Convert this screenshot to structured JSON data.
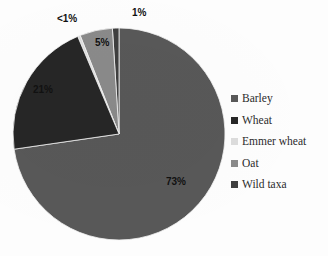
{
  "chart_data": {
    "type": "pie",
    "title": "",
    "subtitle": "",
    "xlabel": "",
    "ylabel": "",
    "grid": false,
    "legend_position": "right",
    "start_angle_deg": 0,
    "direction": "clockwise",
    "categories": [
      "Barley",
      "Wheat",
      "Emmer wheat",
      "Oat",
      "Wild taxa"
    ],
    "values": [
      73,
      21,
      0.4,
      5,
      1
    ],
    "value_labels": [
      "73%",
      "21%",
      "<1%",
      "5%",
      "1%"
    ],
    "colors": [
      "#585858",
      "#262626",
      "#dcdcdc",
      "#8a8a8a",
      "#3f3f3f"
    ],
    "slices": [
      {
        "label": "Barley",
        "value": 73,
        "value_label": "73%",
        "color": "#585858"
      },
      {
        "label": "Wheat",
        "value": 21,
        "value_label": "21%",
        "color": "#262626"
      },
      {
        "label": "Emmer wheat",
        "value": 0.4,
        "value_label": "<1%",
        "color": "#dcdcdc"
      },
      {
        "label": "Oat",
        "value": 5,
        "value_label": "5%",
        "color": "#8a8a8a"
      },
      {
        "label": "Wild taxa",
        "value": 1,
        "value_label": "1%",
        "color": "#3f3f3f"
      }
    ],
    "annotations": []
  },
  "legend": {
    "items": [
      {
        "label": "Barley",
        "color": "#585858"
      },
      {
        "label": "Wheat",
        "color": "#262626"
      },
      {
        "label": "Emmer wheat",
        "color": "#dcdcdc"
      },
      {
        "label": "Oat",
        "color": "#8a8a8a"
      },
      {
        "label": "Wild taxa",
        "color": "#3f3f3f"
      }
    ]
  },
  "labels": {
    "barley": "73%",
    "wheat": "21%",
    "emmer": "<1%",
    "oat": "5%",
    "wild": "1%"
  }
}
